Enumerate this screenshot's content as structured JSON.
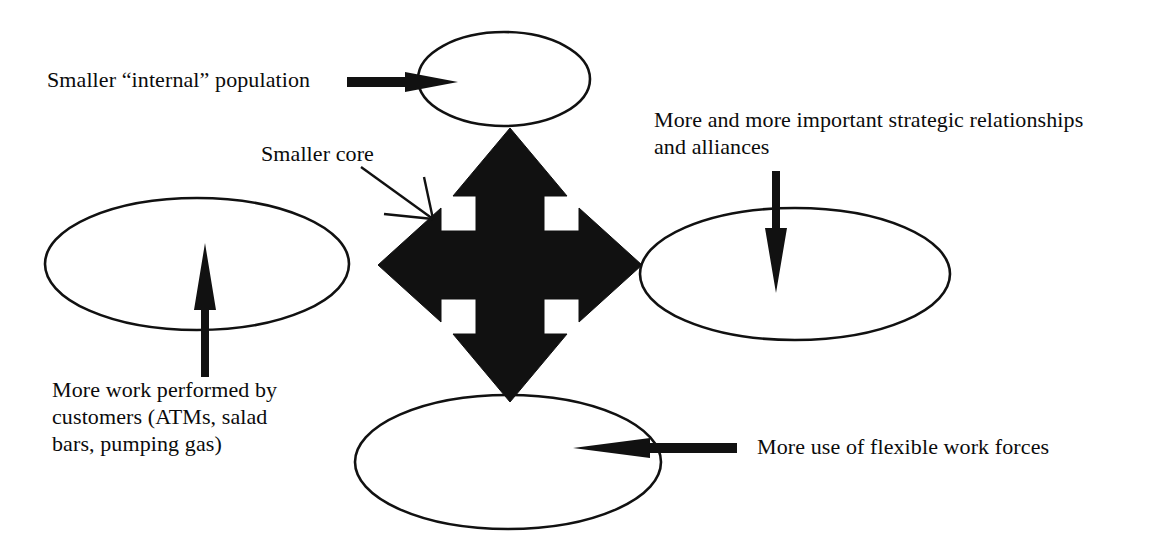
{
  "diagram": {
    "type": "concept-diagram",
    "background_color": "#ffffff",
    "stroke_color": "#000000",
    "fill_color": "#000000",
    "labels": {
      "top_left": "Smaller “internal” population",
      "center_pointer": "Smaller core",
      "right_top_line1": "More and more important strategic relationships",
      "right_top_line2": "and alliances",
      "bottom_left_line1": "More work performed by",
      "bottom_left_line2": "customers (ATMs, salad",
      "bottom_left_line3": "bars, pumping gas)",
      "bottom_right": "More use of flexible work forces"
    },
    "nodes": [
      {
        "name": "top-ellipse",
        "cx": 504,
        "cy": 79,
        "rx": 86,
        "ry": 47
      },
      {
        "name": "left-ellipse",
        "cx": 197,
        "cy": 264,
        "rx": 152,
        "ry": 66
      },
      {
        "name": "right-ellipse",
        "cx": 795,
        "cy": 274,
        "rx": 155,
        "ry": 66
      },
      {
        "name": "bottom-ellipse",
        "cx": 508,
        "cy": 462,
        "rx": 153,
        "ry": 67
      }
    ],
    "center": {
      "name": "four-way-cross-arrow",
      "cx": 510,
      "cy": 265,
      "half_width": 132,
      "half_height": 137,
      "shaft_half": 34,
      "head_half": 57
    },
    "connectors": [
      {
        "name": "top-label-arrow",
        "direction": "right",
        "from_x": 347,
        "to_x": 458,
        "y": 82
      },
      {
        "name": "left-label-arrow",
        "direction": "up",
        "x": 205,
        "from_y": 377,
        "to_y": 243
      },
      {
        "name": "right-label-arrow",
        "direction": "down",
        "x": 776,
        "from_y": 171,
        "to_y": 293
      },
      {
        "name": "bottom-label-arrow",
        "direction": "left",
        "from_x": 737,
        "to_x": 573,
        "y": 448
      },
      {
        "name": "smaller-core-pointer",
        "direction": "down-right",
        "from_x": 361,
        "from_y": 167,
        "to_x": 433,
        "to_y": 219
      }
    ]
  }
}
